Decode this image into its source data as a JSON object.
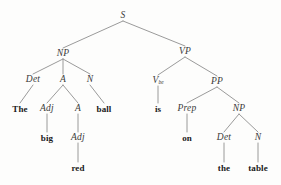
{
  "diagram": {
    "sentence": "The big red ball is on the table",
    "line_color": "#8e8e8e",
    "category_color": "#3a3a3a",
    "word_color": "#1a1a1a",
    "background_color": "#fdfdfc",
    "width": 281,
    "height": 185
  },
  "nodes": [
    {
      "id": "S",
      "label": "S",
      "sub": "",
      "kind": "category",
      "x": 123,
      "y": 16
    },
    {
      "id": "NP1",
      "label": "NP",
      "sub": "",
      "kind": "category",
      "x": 63,
      "y": 54
    },
    {
      "id": "VP",
      "label": "VP",
      "sub": "",
      "kind": "category",
      "x": 185,
      "y": 52
    },
    {
      "id": "Det1",
      "label": "Det",
      "sub": "",
      "kind": "category",
      "x": 33,
      "y": 80
    },
    {
      "id": "A1",
      "label": "A",
      "sub": "",
      "kind": "category",
      "x": 63,
      "y": 80
    },
    {
      "id": "N1",
      "label": "N",
      "sub": "",
      "kind": "category",
      "x": 90,
      "y": 80
    },
    {
      "id": "Vbe",
      "label": "V",
      "sub": "be",
      "kind": "category",
      "x": 158,
      "y": 81
    },
    {
      "id": "PP",
      "label": "PP",
      "sub": "",
      "kind": "category",
      "x": 217,
      "y": 82
    },
    {
      "id": "The",
      "label": "The",
      "sub": "",
      "kind": "word",
      "x": 20,
      "y": 109
    },
    {
      "id": "Adj1",
      "label": "Adj",
      "sub": "",
      "kind": "category",
      "x": 47,
      "y": 109
    },
    {
      "id": "A2",
      "label": "A",
      "sub": "",
      "kind": "category",
      "x": 78,
      "y": 109
    },
    {
      "id": "ball",
      "label": "ball",
      "sub": "",
      "kind": "word",
      "x": 104,
      "y": 109
    },
    {
      "id": "is",
      "label": "is",
      "sub": "",
      "kind": "word",
      "x": 158,
      "y": 109
    },
    {
      "id": "Prep",
      "label": "Prep",
      "sub": "",
      "kind": "category",
      "x": 187,
      "y": 109
    },
    {
      "id": "NP2",
      "label": "NP",
      "sub": "",
      "kind": "category",
      "x": 239,
      "y": 109
    },
    {
      "id": "big",
      "label": "big",
      "sub": "",
      "kind": "word",
      "x": 47,
      "y": 138
    },
    {
      "id": "Adj2",
      "label": "Adj",
      "sub": "",
      "kind": "category",
      "x": 78,
      "y": 138
    },
    {
      "id": "on",
      "label": "on",
      "sub": "",
      "kind": "word",
      "x": 187,
      "y": 138
    },
    {
      "id": "Det2",
      "label": "Det",
      "sub": "",
      "kind": "category",
      "x": 224,
      "y": 138
    },
    {
      "id": "N2",
      "label": "N",
      "sub": "",
      "kind": "category",
      "x": 258,
      "y": 138
    },
    {
      "id": "red",
      "label": "red",
      "sub": "",
      "kind": "word",
      "x": 78,
      "y": 168
    },
    {
      "id": "the",
      "label": "the",
      "sub": "",
      "kind": "word",
      "x": 224,
      "y": 168
    },
    {
      "id": "table",
      "label": "table",
      "sub": "",
      "kind": "word",
      "x": 258,
      "y": 168
    }
  ],
  "edges": [
    {
      "from": "S",
      "to": "NP1"
    },
    {
      "from": "S",
      "to": "VP"
    },
    {
      "from": "NP1",
      "to": "Det1"
    },
    {
      "from": "NP1",
      "to": "A1"
    },
    {
      "from": "NP1",
      "to": "N1"
    },
    {
      "from": "VP",
      "to": "Vbe"
    },
    {
      "from": "VP",
      "to": "PP"
    },
    {
      "from": "Det1",
      "to": "The"
    },
    {
      "from": "A1",
      "to": "Adj1"
    },
    {
      "from": "A1",
      "to": "A2"
    },
    {
      "from": "N1",
      "to": "ball"
    },
    {
      "from": "Vbe",
      "to": "is"
    },
    {
      "from": "PP",
      "to": "Prep"
    },
    {
      "from": "PP",
      "to": "NP2"
    },
    {
      "from": "Adj1",
      "to": "big"
    },
    {
      "from": "A2",
      "to": "Adj2"
    },
    {
      "from": "Prep",
      "to": "on"
    },
    {
      "from": "NP2",
      "to": "Det2"
    },
    {
      "from": "NP2",
      "to": "N2"
    },
    {
      "from": "Adj2",
      "to": "red"
    },
    {
      "from": "Det2",
      "to": "the"
    },
    {
      "from": "N2",
      "to": "table"
    }
  ]
}
